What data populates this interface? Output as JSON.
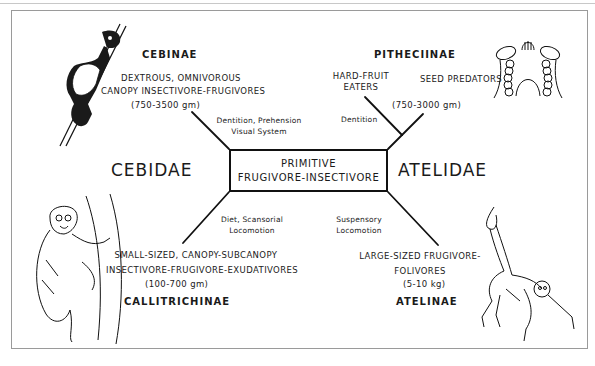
{
  "center_box": {
    "line1": "PRIMITIVE",
    "line2": "FRUGIVORE-INSECTIVORE"
  },
  "families": {
    "left": "CEBIDAE",
    "right": "ATELIDAE"
  },
  "branches": {
    "top_left": {
      "edge_label_1": "Dentition, Prehension",
      "edge_label_2": "Visual System",
      "subfamily": "CEBINAE",
      "desc_1": "DEXTROUS, OMNIVOROUS",
      "desc_2": "CANOPY INSECTIVORE-FRUGIVORES",
      "mass": "(750-3500 gm)",
      "illustration": "capuchin-monkey-climbing-branch"
    },
    "top_right": {
      "edge_label": "Dentition",
      "subfamily": "PITHECIINAE",
      "group_a_1": "HARD-FRUIT",
      "group_a_2": "EATERS",
      "group_b": "SEED PREDATORS",
      "mass": "(750-3000 gm)",
      "illustration": "saki-dental-arcade"
    },
    "bottom_left": {
      "edge_label_1": "Diet, Scansorial",
      "edge_label_2": "Locomotion",
      "desc_1": "SMALL-SIZED, CANOPY-SUBCANOPY",
      "desc_2": "INSECTIVORE-FRUGIVORE-EXUDATIVORES",
      "mass": "(100-700 gm)",
      "subfamily": "CALLITRICHINAE",
      "illustration": "marmoset-clinging-trunk"
    },
    "bottom_right": {
      "edge_label_1": "Suspensory",
      "edge_label_2": "Locomotion",
      "desc_1": "LARGE-SIZED FRUGIVORE-",
      "desc_2": "FOLIVORES",
      "mass": "(5-10 kg)",
      "subfamily": "ATELINAE",
      "illustration": "spider-monkey-hanging-by-tail"
    }
  }
}
